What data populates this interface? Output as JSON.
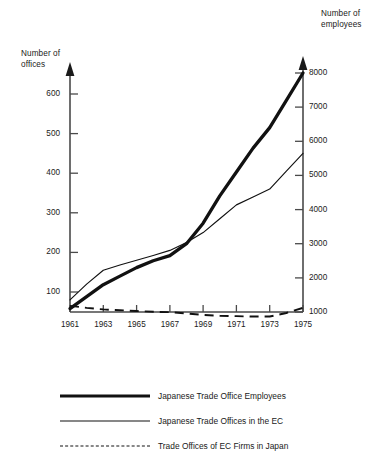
{
  "left_axis": {
    "title": "Number of\noffices",
    "ticks": [
      100,
      200,
      300,
      400,
      500,
      600
    ]
  },
  "right_axis": {
    "title": "Number of\nemployees",
    "ticks": [
      1000,
      2000,
      3000,
      4000,
      5000,
      6000,
      7000,
      8000
    ]
  },
  "x_axis": {
    "ticks": [
      "1961",
      "1963",
      "1965",
      "1967",
      "1969",
      "1971",
      "1973",
      "1975"
    ]
  },
  "legend": {
    "items": [
      {
        "label": "Japanese Trade Office Employees",
        "style": "thick-solid",
        "color": "#111111"
      },
      {
        "label": "Japanese Trade Offices in the EC",
        "style": "thin-solid",
        "color": "#111111"
      },
      {
        "label": "Trade Offices of EC Firms in Japan",
        "style": "dashed",
        "color": "#111111"
      }
    ]
  },
  "chart_data": {
    "type": "line",
    "title": "",
    "xlabel": "",
    "ylabel": "Number of offices",
    "y2label": "Number of employees",
    "grid": false,
    "legend_position": "bottom",
    "x": [
      1961,
      1962,
      1963,
      1964,
      1965,
      1966,
      1967,
      1968,
      1969,
      1970,
      1971,
      1972,
      1973,
      1974,
      1975
    ],
    "xlim": [
      1961,
      1975
    ],
    "ylim": [
      0,
      650
    ],
    "y2lim": [
      1000,
      8200
    ],
    "series": [
      {
        "name": "Japanese Trade Offices in the EC",
        "axis": "left",
        "style": "thin-solid",
        "unit": "offices",
        "values": [
          80,
          120,
          155,
          168,
          180,
          192,
          205,
          225,
          250,
          285,
          320,
          340,
          360,
          405,
          450
        ]
      },
      {
        "name": "Japanese Trade Office Employees",
        "axis": "right",
        "style": "thick-solid",
        "unit": "employees",
        "values": [
          1100,
          1450,
          1800,
          2050,
          2300,
          2500,
          2650,
          3000,
          3600,
          4400,
          5100,
          5800,
          6400,
          7200,
          8000
        ]
      },
      {
        "name": "Trade Offices of EC Firms in Japan",
        "axis": "left",
        "style": "dashed",
        "unit": "offices",
        "values": [
          65,
          60,
          56,
          54,
          52,
          50,
          49,
          46,
          42,
          40,
          39,
          38,
          38,
          47,
          60
        ]
      }
    ]
  }
}
